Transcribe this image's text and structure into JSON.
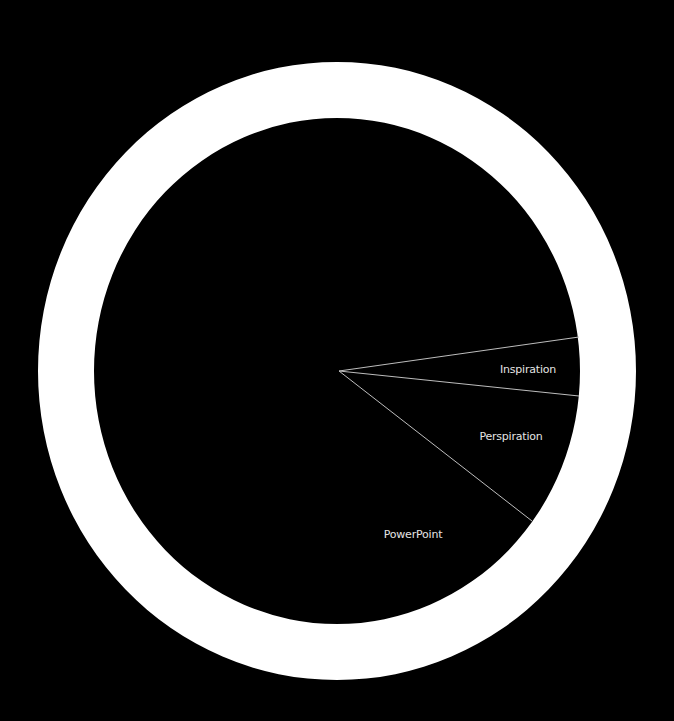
{
  "chart_data": {
    "type": "pie",
    "title": "",
    "categories": [
      "Inspiration",
      "Perspiration",
      "PowerPoint"
    ],
    "values": [
      4,
      9,
      87
    ],
    "unit": "%",
    "legend": "none (labels inside slices)",
    "grid": false,
    "style": "donut-ring with wedge divider lines",
    "slices": [
      {
        "label": "Inspiration",
        "value": 4,
        "start_deg": -8.1,
        "end_deg": 6.0
      },
      {
        "label": "Perspiration",
        "value": 9,
        "start_deg": 6.0,
        "end_deg": 37.9
      },
      {
        "label": "PowerPoint",
        "value": 87,
        "start_deg": 37.9,
        "end_deg": 351.9
      }
    ]
  },
  "colors": {
    "background": "#000000",
    "ring": "#ffffff",
    "divider": "#bdbdbd",
    "label": "#e4e4e4"
  },
  "geometry": {
    "ring_cx": 337,
    "ring_cy": 371,
    "ring_outer_rx": 299,
    "ring_outer_ry": 309,
    "ring_inner_rx": 243,
    "ring_inner_ry": 253,
    "apex_x": 339,
    "apex_y": 371,
    "dividers": [
      {
        "x2": 579,
        "y2": 337
      },
      {
        "x2": 579,
        "y2": 396
      },
      {
        "x2": 532,
        "y2": 521
      }
    ]
  },
  "labels": {
    "inspiration": {
      "text": "Inspiration",
      "x": 528,
      "y": 369
    },
    "perspiration": {
      "text": "Perspiration",
      "x": 511,
      "y": 436
    },
    "powerpoint": {
      "text": "PowerPoint",
      "x": 413,
      "y": 534
    }
  }
}
